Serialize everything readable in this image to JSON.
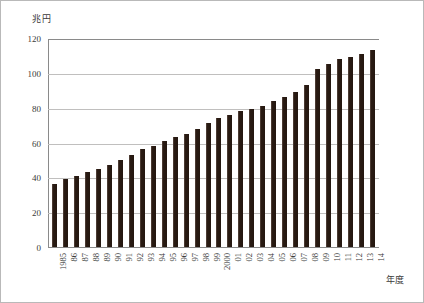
{
  "figure": {
    "unit_label": "兆円",
    "xaxis_name": "年度",
    "background": "#ffffff",
    "border_color": "#b9b9b9",
    "bar_color": "#2b1c14",
    "grid_color": "#c0bfbe",
    "axis_color": "#8a8a8a"
  },
  "chart_data": {
    "type": "bar",
    "title": "",
    "subtitle": "",
    "xlabel": "年度",
    "ylabel": "兆円",
    "ylim": [
      0,
      120
    ],
    "yticks": [
      0,
      20,
      40,
      60,
      80,
      100,
      120
    ],
    "ytick_labels": [
      "0",
      "20",
      "40",
      "60",
      "80",
      "100",
      "120"
    ],
    "grid": true,
    "grid_axis": "y",
    "legend": false,
    "legend_position": "none",
    "categories": [
      "1985",
      "86",
      "87",
      "88",
      "89",
      "90",
      "91",
      "92",
      "93",
      "94",
      "95",
      "96",
      "97",
      "98",
      "99",
      "2000",
      "01",
      "02",
      "03",
      "04",
      "05",
      "06",
      "07",
      "08",
      "09",
      "10",
      "11",
      "12",
      "13",
      "14"
    ],
    "values": [
      36,
      39,
      41,
      43,
      45,
      47,
      50,
      53,
      56,
      58,
      61,
      63,
      65,
      68,
      71,
      74,
      76,
      78,
      79,
      81,
      84,
      86,
      89,
      93,
      102,
      105,
      108,
      109,
      111,
      113
    ],
    "annotations": []
  }
}
